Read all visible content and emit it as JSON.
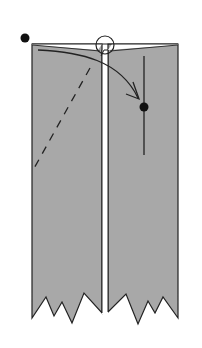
{
  "diagram": {
    "type": "folding-instruction",
    "colors": {
      "paper": "#a8a8a8",
      "stroke": "#222222",
      "background": "#ffffff",
      "gap": "#ffffff"
    },
    "elements": {
      "left_panel": "paper-strip-left",
      "right_panel": "paper-strip-right",
      "fold_arrow": "curved-arrow",
      "valley_fold": "dashed-line",
      "start_point": "dot",
      "end_point": "dot",
      "reference_line": "vertical-line",
      "focus_circle": "circle"
    }
  }
}
